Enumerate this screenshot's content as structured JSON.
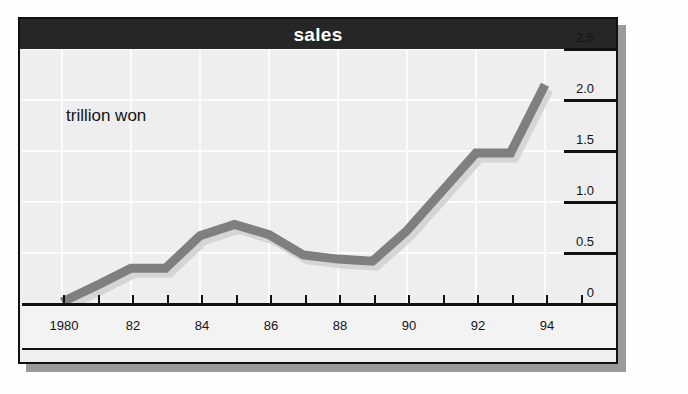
{
  "chart": {
    "title": "sales",
    "unit_label": "trillion won"
  },
  "chart_data": {
    "type": "line",
    "title": "sales",
    "subtitle": "",
    "xlabel": "",
    "ylabel": "trillion won",
    "annotations": [
      "trillion won"
    ],
    "grid": true,
    "legend": "none",
    "y_axis_position": "right",
    "xlim": [
      1980,
      1995
    ],
    "ylim": [
      0,
      2.5
    ],
    "yticks": [
      0,
      0.5,
      1.0,
      1.5,
      2.0,
      2.5
    ],
    "ytick_labels": [
      "0",
      "0.5",
      "1.0",
      "1.5",
      "2.0",
      "2.5"
    ],
    "xticks": [
      1980,
      1981,
      1982,
      1983,
      1984,
      1985,
      1986,
      1987,
      1988,
      1989,
      1990,
      1991,
      1992,
      1993,
      1994,
      1995
    ],
    "xtick_labels": [
      "1980",
      "",
      "82",
      "",
      "84",
      "",
      "86",
      "",
      "88",
      "",
      "90",
      "",
      "92",
      "",
      "94",
      ""
    ],
    "x": [
      1980,
      1981,
      1982,
      1983,
      1984,
      1985,
      1986,
      1987,
      1988,
      1989,
      1990,
      1991,
      1992,
      1993,
      1994
    ],
    "values": [
      0.02,
      0.18,
      0.35,
      0.35,
      0.67,
      0.78,
      0.68,
      0.48,
      0.44,
      0.42,
      0.72,
      1.1,
      1.48,
      1.48,
      2.15
    ],
    "series_name": "sales",
    "line_color": "#7f7f7f",
    "line_width_px": 9
  },
  "colors": {
    "title_bar": "#262626",
    "title_text": "#ffffff",
    "plot_background": "#eeeeee",
    "gridline": "#fbfbfb",
    "axis": "#111111",
    "series": "#7f7f7f",
    "shadow": "#9a9a9a"
  }
}
